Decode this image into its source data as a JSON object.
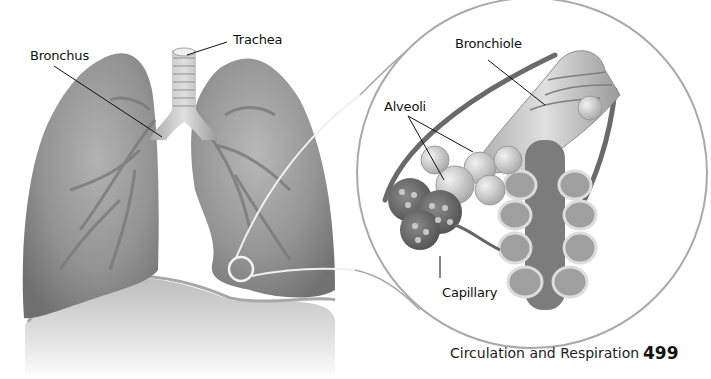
{
  "figure": {
    "labels": {
      "trachea": "Trachea",
      "bronchus": "Bronchus",
      "bronchiole": "Bronchiole",
      "alveoli": "Alveoli",
      "capillary": "Capillary"
    },
    "colors": {
      "lung_fill": "#8f8f8f",
      "lung_dark": "#6e6e6e",
      "lung_light": "#b4b4b4",
      "airway": "#d9d9d9",
      "diaphragm": "#c9c9c9",
      "magnifier_ring": "#a9a9a9",
      "leader_line": "#111111"
    }
  },
  "footer": {
    "chapter_title": "Circulation and Respiration",
    "page_number": "499"
  }
}
